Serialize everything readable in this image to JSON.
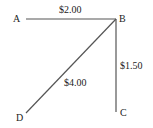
{
  "diagram": {
    "nodes": [
      {
        "id": "A",
        "label": "A"
      },
      {
        "id": "B",
        "label": "B"
      },
      {
        "id": "C",
        "label": "C"
      },
      {
        "id": "D",
        "label": "D"
      }
    ],
    "edges": [
      {
        "from": "A",
        "to": "B",
        "label": "$2.00"
      },
      {
        "from": "B",
        "to": "C",
        "label": "$1.50"
      },
      {
        "from": "B",
        "to": "D",
        "label": "$4.00"
      }
    ],
    "line_color": "#555555",
    "text_color": "#222222"
  }
}
